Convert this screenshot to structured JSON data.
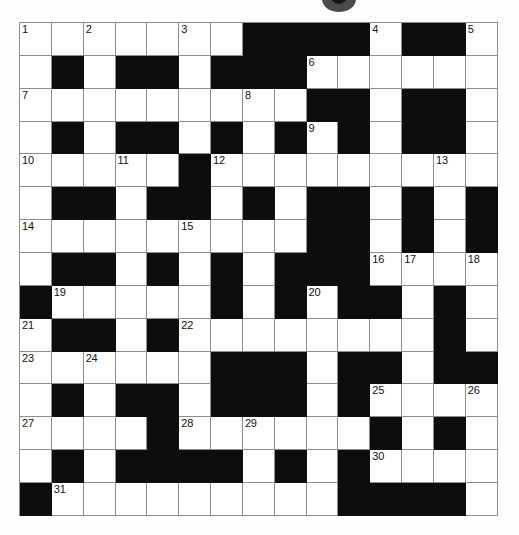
{
  "puzzle": {
    "title": "Crossword Grid",
    "type": "crossword",
    "rows": 15,
    "cols": 15,
    "cell_size_px": 32,
    "colors": {
      "block": "#0d0d0d",
      "open": "#ffffff",
      "grid_line": "#8d8d8d",
      "number_text": "#111111",
      "page_background": "#ffffff"
    },
    "legend": {
      "black_value": 1,
      "white_value": 0
    },
    "grid": [
      [
        0,
        0,
        0,
        0,
        0,
        0,
        0,
        1,
        1,
        1,
        1,
        0,
        1,
        1,
        0
      ],
      [
        0,
        1,
        0,
        1,
        1,
        0,
        1,
        1,
        1,
        0,
        0,
        0,
        0,
        0,
        0
      ],
      [
        0,
        0,
        0,
        0,
        0,
        0,
        0,
        0,
        0,
        1,
        1,
        0,
        1,
        1,
        0
      ],
      [
        0,
        1,
        0,
        1,
        1,
        0,
        1,
        0,
        1,
        0,
        1,
        0,
        1,
        1,
        0
      ],
      [
        0,
        0,
        0,
        0,
        0,
        1,
        0,
        0,
        0,
        0,
        0,
        0,
        0,
        0,
        0
      ],
      [
        0,
        1,
        1,
        0,
        1,
        1,
        0,
        1,
        0,
        1,
        1,
        0,
        1,
        0,
        1
      ],
      [
        0,
        0,
        0,
        0,
        0,
        0,
        0,
        0,
        0,
        1,
        1,
        0,
        1,
        0,
        1
      ],
      [
        0,
        1,
        1,
        0,
        1,
        0,
        1,
        0,
        1,
        1,
        1,
        0,
        0,
        0,
        0
      ],
      [
        1,
        0,
        0,
        0,
        0,
        0,
        1,
        0,
        1,
        0,
        1,
        1,
        0,
        1,
        0
      ],
      [
        0,
        1,
        1,
        0,
        1,
        0,
        0,
        0,
        0,
        0,
        0,
        0,
        0,
        1,
        0
      ],
      [
        0,
        0,
        0,
        0,
        0,
        0,
        1,
        1,
        1,
        0,
        1,
        1,
        0,
        1,
        1
      ],
      [
        0,
        1,
        0,
        1,
        1,
        0,
        1,
        1,
        1,
        0,
        1,
        0,
        0,
        0,
        0
      ],
      [
        0,
        0,
        0,
        0,
        1,
        0,
        0,
        0,
        0,
        0,
        0,
        1,
        0,
        1,
        0
      ],
      [
        0,
        1,
        0,
        1,
        1,
        1,
        1,
        0,
        1,
        0,
        1,
        0,
        0,
        0,
        0
      ],
      [
        1,
        0,
        0,
        0,
        0,
        0,
        0,
        0,
        0,
        0,
        1,
        1,
        1,
        1,
        0
      ]
    ],
    "numbers": [
      {
        "row": 0,
        "col": 0,
        "label": "1"
      },
      {
        "row": 0,
        "col": 2,
        "label": "2"
      },
      {
        "row": 0,
        "col": 5,
        "label": "3"
      },
      {
        "row": 0,
        "col": 11,
        "label": "4"
      },
      {
        "row": 0,
        "col": 14,
        "label": "5"
      },
      {
        "row": 1,
        "col": 9,
        "label": "6"
      },
      {
        "row": 2,
        "col": 0,
        "label": "7"
      },
      {
        "row": 2,
        "col": 7,
        "label": "8"
      },
      {
        "row": 3,
        "col": 9,
        "label": "9"
      },
      {
        "row": 4,
        "col": 0,
        "label": "10"
      },
      {
        "row": 4,
        "col": 3,
        "label": "11"
      },
      {
        "row": 4,
        "col": 6,
        "label": "12"
      },
      {
        "row": 4,
        "col": 13,
        "label": "13"
      },
      {
        "row": 6,
        "col": 0,
        "label": "14"
      },
      {
        "row": 6,
        "col": 5,
        "label": "15"
      },
      {
        "row": 7,
        "col": 11,
        "label": "16"
      },
      {
        "row": 7,
        "col": 12,
        "label": "17"
      },
      {
        "row": 7,
        "col": 14,
        "label": "18"
      },
      {
        "row": 8,
        "col": 1,
        "label": "19"
      },
      {
        "row": 8,
        "col": 9,
        "label": "20"
      },
      {
        "row": 9,
        "col": 0,
        "label": "21"
      },
      {
        "row": 9,
        "col": 5,
        "label": "22"
      },
      {
        "row": 10,
        "col": 0,
        "label": "23"
      },
      {
        "row": 10,
        "col": 2,
        "label": "24"
      },
      {
        "row": 11,
        "col": 11,
        "label": "25"
      },
      {
        "row": 11,
        "col": 14,
        "label": "26"
      },
      {
        "row": 12,
        "col": 0,
        "label": "27"
      },
      {
        "row": 12,
        "col": 5,
        "label": "28"
      },
      {
        "row": 12,
        "col": 7,
        "label": "29"
      },
      {
        "row": 13,
        "col": 11,
        "label": "30"
      },
      {
        "row": 14,
        "col": 1,
        "label": "31"
      }
    ],
    "entries": []
  }
}
